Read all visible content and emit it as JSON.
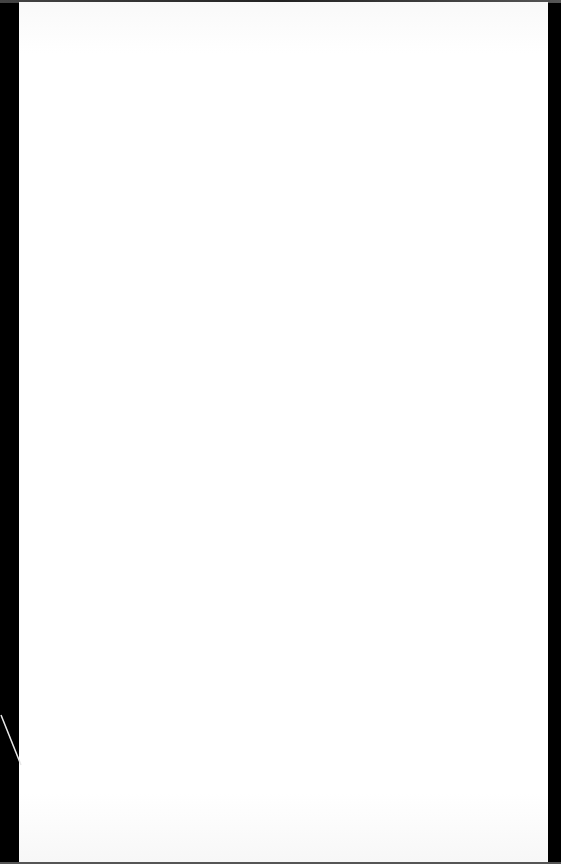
{
  "document": {
    "description": "Photograph of a blank sheet of paper against a black background",
    "header_text": "",
    "body_text": "",
    "colors": {
      "background": "#000000",
      "paper": "#ffffff"
    }
  }
}
